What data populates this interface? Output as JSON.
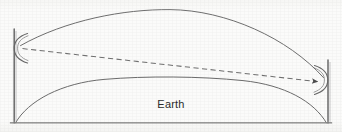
{
  "figure": {
    "kind": "line-diagram",
    "width": 342,
    "height": 132,
    "background_color": "#fbfbfa",
    "ink_color": "#555555",
    "dash_color": "#6b6b6b",
    "label_color": "#2b2b2b",
    "labels": {
      "earth": "Earth"
    },
    "elements": {
      "left_tower_name": "left-tower-mast",
      "right_tower_name": "right-tower-mast",
      "left_antenna_name": "left-antenna-horn",
      "right_antenna_name": "right-antenna-horn",
      "refracted_path_name": "refracted-ray-arc",
      "direct_path_name": "direct-line-of-sight-dashed",
      "earth_surface_name": "earth-surface-arc",
      "baseline_name": "ground-baseline"
    },
    "geometry": {
      "left_mast": {
        "x": 14,
        "y_top": 29,
        "y_bottom": 123
      },
      "right_mast": {
        "x": 328,
        "y_top": 60,
        "y_bottom": 123
      },
      "left_horn": {
        "cx": 20,
        "cy": 48,
        "r": 16,
        "opens": "right"
      },
      "right_horn": {
        "cx": 322,
        "cy": 80,
        "r": 16,
        "opens": "left"
      },
      "upper_arc": {
        "start": [
          20,
          46
        ],
        "peak": [
          168,
          10
        ],
        "end": [
          323,
          78
        ]
      },
      "dashed_line": {
        "start": [
          22,
          49
        ],
        "end": [
          318,
          82
        ],
        "arrow_at": "end"
      },
      "earth_arc": {
        "start": [
          16,
          123
        ],
        "peak": [
          172,
          78
        ],
        "end": [
          326,
          123
        ]
      },
      "baseline": {
        "x1": 11,
        "x2": 331,
        "y": 123
      }
    }
  }
}
